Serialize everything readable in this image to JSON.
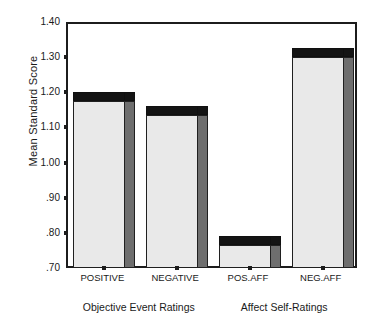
{
  "chart_data": {
    "type": "bar",
    "title": "",
    "xlabel": "",
    "ylabel": "Mean Standard Score",
    "categories": [
      "POSITIVE",
      "NEGATIVE",
      "POS.AFF",
      "NEG.AFF"
    ],
    "values": [
      1.18,
      1.14,
      0.77,
      1.305
    ],
    "ylim": [
      0.7,
      1.4
    ],
    "ytick_labels": [
      "1.40",
      "1.30",
      "1.20",
      "1.10",
      "1.00",
      ".90",
      ".80",
      ".70"
    ],
    "ytick_values": [
      1.4,
      1.3,
      1.2,
      1.1,
      1.0,
      0.9,
      0.8,
      0.7
    ],
    "grid": false,
    "legend": "none",
    "style": "3d-bars",
    "group_labels": [
      "Objective Event Ratings",
      "Affect Self-Ratings"
    ],
    "group_spans": [
      [
        0,
        1
      ],
      [
        2,
        3
      ]
    ],
    "colors": {
      "bar_face": "#e9e9e9",
      "bar_side": "#6e6e6e",
      "bar_top": "#141414",
      "axis": "#1c1c1c",
      "text": "#1a1a1a",
      "background": "#ffffff"
    }
  }
}
